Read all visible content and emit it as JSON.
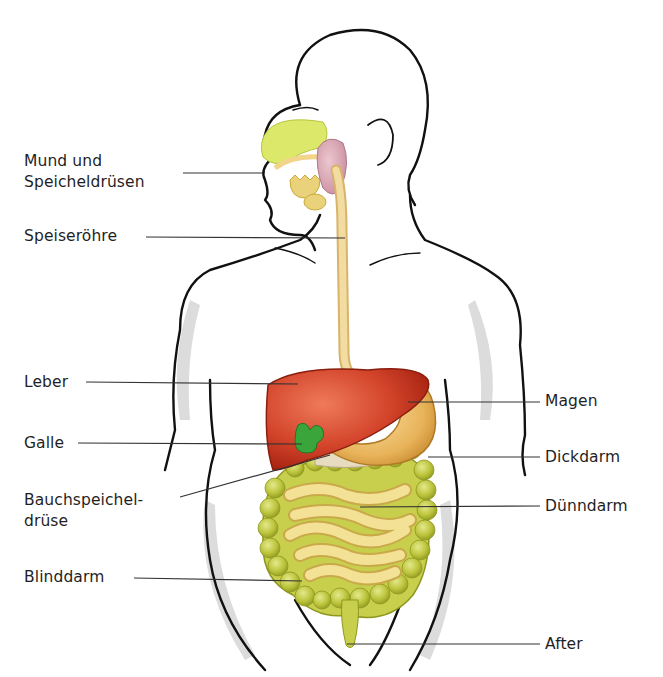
{
  "diagram": {
    "labels_left": [
      {
        "id": "mund",
        "line1": "Mund und",
        "line2": "Speicheldrüsen"
      },
      {
        "id": "speiseroehre",
        "line1": "Speiseröhre"
      },
      {
        "id": "leber",
        "line1": "Leber"
      },
      {
        "id": "galle",
        "line1": "Galle"
      },
      {
        "id": "bauchspeicheldruese",
        "line1": "Bauchspeichel-",
        "line2": "drüse"
      },
      {
        "id": "blinddarm",
        "line1": "Blinddarm"
      }
    ],
    "labels_right": [
      {
        "id": "magen",
        "line1": "Magen"
      },
      {
        "id": "dickdarm",
        "line1": "Dickdarm"
      },
      {
        "id": "duenndarm",
        "line1": "Dünndarm"
      },
      {
        "id": "after",
        "line1": "After"
      }
    ],
    "colors": {
      "outline": "#111111",
      "shadow": "#d9d9d9",
      "liver": "#c9361f",
      "liver_light": "#e8674a",
      "gallbladder": "#3aa53a",
      "stomach": "#e9b45e",
      "stomach_light": "#f6d894",
      "esophagus": "#f1d79a",
      "large_intestine": "#b9c23a",
      "small_intestine": "#f2e08c",
      "salivary_gland": "#d9a5b3",
      "nasal": "#dbe86a",
      "pancreas": "#e8dcc0",
      "leader_line": "#333333",
      "text": "#1f1f1f"
    }
  }
}
